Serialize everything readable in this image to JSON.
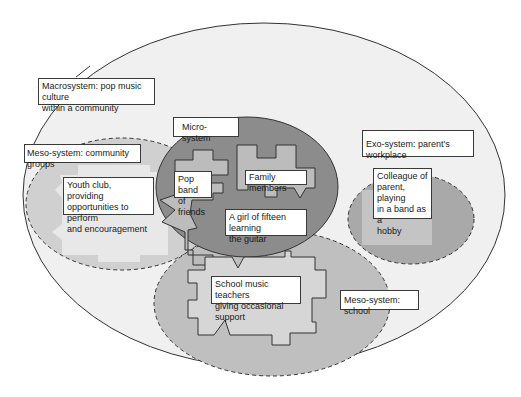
{
  "diagram": {
    "colors": {
      "background": "#ffffff",
      "macro_fill": "#f0f0f0",
      "meso_community_fill": "#d0d0d0",
      "meso_community_inner": "#e6e6e6",
      "micro_fill": "#8c8c8c",
      "micro_shape_fill": "#bcbcbc",
      "school_fill": "#bfbfbf",
      "school_shape_fill": "#d6d6d6",
      "exo_fill": "#a9a9a9",
      "exo_inner": "#c4c4c4",
      "stroke": "#333333"
    },
    "labels": {
      "macrosystem": "Macrosystem: pop music culture\nwithin a community",
      "micro_system": "Micro-system",
      "meso_community": "Meso-system: community groups",
      "youth_club": "Youth club, providing\nopportunities to perform\nand encouragement",
      "pop_band": "Pop band\nof friends",
      "family": "Family members",
      "girl": "A girl of fifteen learning\nthe guitar",
      "exo_system": "Exo-system: parent's workplace",
      "colleague": "Colleague of\nparent, playing\nin a band as a\nhobby",
      "school_teachers": "School music teachers\ngiving occasional support",
      "meso_school": "Meso-system: school"
    }
  }
}
